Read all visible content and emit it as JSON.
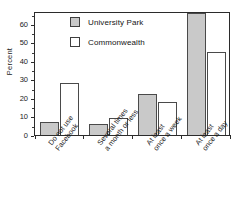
{
  "chart_data": {
    "type": "bar",
    "title": "",
    "xlabel": "",
    "ylabel": "Percent",
    "ylim": [
      0,
      67
    ],
    "yticks": [
      0,
      10,
      20,
      30,
      40,
      50,
      60
    ],
    "grid": false,
    "legend_position": "top-center-inside",
    "categories": [
      "Do not use Facebook",
      "Several times a month or less",
      "At least once a week",
      "At least once a day"
    ],
    "category_lines": [
      [
        "Do not use",
        "Facebook"
      ],
      [
        "Several times",
        "a month or less"
      ],
      [
        "At least",
        "once a week"
      ],
      [
        "At least",
        "once a day"
      ]
    ],
    "series": [
      {
        "name": "University Park",
        "color": "#c9c9c9",
        "values": [
          7,
          6,
          22,
          66
        ]
      },
      {
        "name": "Commonwealth",
        "color": "#ffffff",
        "values": [
          28,
          9,
          18,
          45
        ]
      }
    ]
  },
  "axis": {
    "ylabel_text": "Percent",
    "ytick_labels": [
      "0",
      "10",
      "20",
      "30",
      "40",
      "50",
      "60"
    ]
  },
  "legend": {
    "entries": [
      {
        "label": "University Park",
        "swatch": "gray-filled-square"
      },
      {
        "label": "Commonwealth",
        "swatch": "white-filled-square"
      }
    ]
  },
  "colors": {
    "series_university_park": "#c9c9c9",
    "series_commonwealth": "#ffffff",
    "axis_line": "#2b2b2b",
    "bar_outline": "#4a4a4a",
    "text": "#1a1a1a"
  }
}
